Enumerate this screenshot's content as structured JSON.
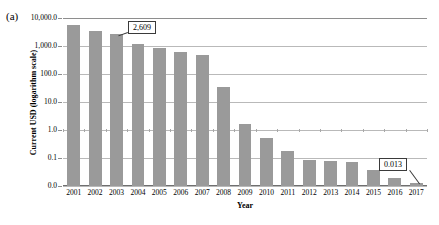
{
  "figure": {
    "panel_label": "(a)",
    "axis_title_y": "Current USD (logarithm scale)",
    "axis_title_x": "Year"
  },
  "chart_data": {
    "type": "bar",
    "title": "",
    "subtitle": "",
    "xlabel": "Year",
    "ylabel": "Current USD (logarithm scale)",
    "scale": "log",
    "grid": true,
    "legend": "none",
    "categories": [
      "2001",
      "2002",
      "2003",
      "2004",
      "2005",
      "2006",
      "2007",
      "2008",
      "2009",
      "2010",
      "2011",
      "2012",
      "2013",
      "2014",
      "2015",
      "2016",
      "2017"
    ],
    "values": [
      5500,
      3400,
      2609,
      1200,
      880,
      600,
      480,
      33,
      1.7,
      0.52,
      0.18,
      0.085,
      0.08,
      0.07,
      0.038,
      0.02,
      0.013
    ],
    "ytick_labels": [
      "10,000.0",
      "1,000.0",
      "100.0",
      "10.0",
      "1.0",
      "0.1",
      "0.0"
    ],
    "ytick_values": [
      10000,
      1000,
      100,
      10,
      1,
      0.1,
      0.01
    ],
    "ylim": [
      0.01,
      10000
    ],
    "annotations": [
      {
        "label": "2,609",
        "category": "2003",
        "value": 2609
      },
      {
        "label": "0.013",
        "category": "2017",
        "value": 0.013
      }
    ],
    "series_color": "#9a9a9a"
  }
}
